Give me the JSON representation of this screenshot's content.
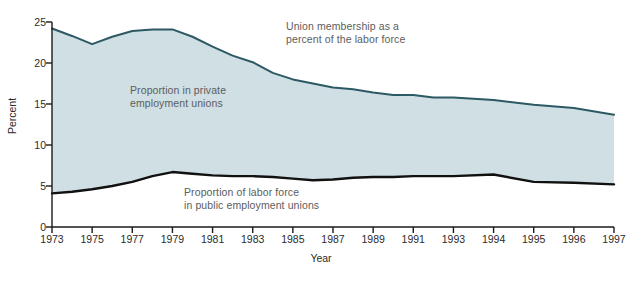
{
  "chart_data": {
    "type": "area",
    "title": "",
    "xlabel": "Year",
    "ylabel": "Percent",
    "xlim": [
      1973,
      1997
    ],
    "ylim": [
      0,
      25
    ],
    "grid": false,
    "legend_position": "inline-annotations",
    "y_ticks": [
      0,
      5,
      10,
      15,
      20,
      25
    ],
    "x_ticks": [
      1973,
      1975,
      1977,
      1979,
      1981,
      1983,
      1985,
      1987,
      1989,
      1991,
      1993,
      1994,
      1995,
      1996,
      1997
    ],
    "x_tick_labels": [
      "1973",
      "1975",
      "1977",
      "1979",
      "1981",
      "1983",
      "1985",
      "1987",
      "1989",
      "1991",
      "1993",
      "1994",
      "1995",
      "1996",
      "1997"
    ],
    "x": [
      1973,
      1974,
      1975,
      1976,
      1977,
      1978,
      1979,
      1980,
      1981,
      1982,
      1983,
      1984,
      1985,
      1986,
      1987,
      1988,
      1989,
      1990,
      1991,
      1992,
      1993,
      1994,
      1995,
      1996,
      1997
    ],
    "series": [
      {
        "name": "Union membership as a percent of the labor force",
        "color": "#2c5963",
        "values": [
          24.2,
          23.3,
          22.3,
          23.2,
          23.9,
          24.1,
          24.1,
          23.2,
          22.0,
          20.9,
          20.1,
          18.8,
          18.0,
          17.5,
          17.0,
          16.8,
          16.4,
          16.1,
          16.1,
          15.8,
          15.8,
          15.5,
          14.9,
          14.5,
          13.7
        ]
      },
      {
        "name": "Proportion of labor force in public employment unions",
        "color": "#111111",
        "values": [
          4.1,
          4.3,
          4.6,
          5.0,
          5.5,
          6.2,
          6.7,
          6.5,
          6.3,
          6.2,
          6.2,
          6.1,
          5.9,
          5.7,
          5.8,
          6.0,
          6.1,
          6.1,
          6.2,
          6.2,
          6.2,
          6.4,
          5.5,
          5.4,
          5.2
        ]
      }
    ],
    "bands": [
      {
        "name": "Proportion in private employment unions",
        "fill": "#cfdfe3",
        "between": [
          "public",
          "total"
        ]
      }
    ],
    "annotations": [
      {
        "id": "total-label",
        "text": "Union membership as a\npercent of the labor force"
      },
      {
        "id": "private-label",
        "text": "Proportion in private\nemployment unions"
      },
      {
        "id": "public-label",
        "text": "Proportion of labor force\nin public employment unions"
      }
    ],
    "colors": {
      "fill": "#cfdfe3",
      "total_line": "#2c5963",
      "public_line": "#111111",
      "axis": "#1a1a1a",
      "text": "#2b2b2b",
      "annotation_text": "#5d5d5d",
      "background": "#ffffff"
    }
  }
}
